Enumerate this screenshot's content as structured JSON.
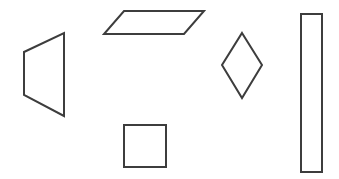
{
  "canvas": {
    "width": 339,
    "height": 179,
    "background_color": "#ffffff",
    "stroke_color": "#3d3d3d",
    "fill_color": "#ffffff",
    "stroke_width": 2,
    "title": "Geometric Shapes"
  },
  "shapes": [
    {
      "id": "trapezoid",
      "name": "trapezoid",
      "label": "Trapezoid",
      "type": "polygon",
      "points": "24,52 64,33 64,116 24,95",
      "vertices": [
        [
          24,
          52
        ],
        [
          64,
          33
        ],
        [
          64,
          116
        ],
        [
          24,
          95
        ]
      ],
      "bbox": [
        24,
        33,
        40,
        83
      ],
      "stroke_color": "#3d3d3d",
      "fill_color": "#ffffff"
    },
    {
      "id": "parallelogram",
      "name": "parallelogram",
      "label": "Parallelogram",
      "type": "polygon",
      "points": "124,11 204,11 184,34 104,34",
      "vertices": [
        [
          124,
          11
        ],
        [
          204,
          11
        ],
        [
          184,
          34
        ],
        [
          104,
          34
        ]
      ],
      "bbox": [
        104,
        11,
        100,
        23
      ],
      "stroke_color": "#3d3d3d",
      "fill_color": "#ffffff"
    },
    {
      "id": "diamond",
      "name": "diamond",
      "label": "Diamond",
      "type": "polygon",
      "points": "242,33 262,65 242,98 222,65",
      "vertices": [
        [
          242,
          33
        ],
        [
          262,
          65
        ],
        [
          242,
          98
        ],
        [
          222,
          65
        ]
      ],
      "bbox": [
        222,
        33,
        40,
        65
      ],
      "stroke_color": "#3d3d3d",
      "fill_color": "#ffffff"
    },
    {
      "id": "square",
      "name": "square",
      "label": "Square",
      "type": "polygon",
      "points": "124,125 166,125 166,167 124,167",
      "vertices": [
        [
          124,
          125
        ],
        [
          166,
          125
        ],
        [
          166,
          167
        ],
        [
          124,
          167
        ]
      ],
      "bbox": [
        124,
        125,
        42,
        42
      ],
      "stroke_color": "#3d3d3d",
      "fill_color": "#ffffff"
    },
    {
      "id": "tall-rectangle",
      "name": "tall-rectangle",
      "label": "Tall Rectangle",
      "type": "polygon",
      "points": "301,14 322,14 322,172 301,172",
      "vertices": [
        [
          301,
          14
        ],
        [
          322,
          14
        ],
        [
          322,
          172
        ],
        [
          301,
          172
        ]
      ],
      "bbox": [
        301,
        14,
        21,
        158
      ],
      "stroke_color": "#3d3d3d",
      "fill_color": "#ffffff"
    }
  ]
}
